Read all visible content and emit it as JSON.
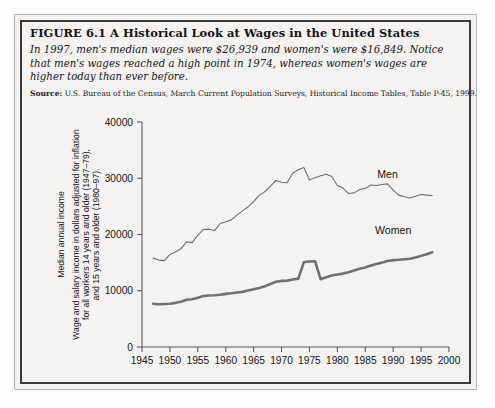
{
  "figure": {
    "title": "FIGURE 6.1  A Historical Look at Wages in the United States",
    "caption": "In 1997, men's median wages were $26,939 and women's were $16,849. Notice that men's wages reached a high point in 1974, whereas women's wages are higher today than ever before.",
    "source_label": "Source:",
    "source_text": " U.S. Bureau of the Census, March Current Population Surveys, Historical Income Tables, Table P-45, 1999."
  },
  "chart_data": {
    "type": "line",
    "title": "",
    "xlabel": "",
    "ylabel_top": "Median annual income",
    "ylabel": "Wage and salary income in dollars adjusted for inflation for all workers 14 years and older (1947–79), and 15 years and older (1980–97).",
    "ylabel_lines": [
      "Wage and salary income in dollars adjusted for inflation",
      "for all workers 14 years and older (1947–79),",
      "and 15 years and older (1980–97)."
    ],
    "xlim": [
      1945,
      2000
    ],
    "ylim": [
      0,
      40000
    ],
    "xticks": [
      1945,
      1950,
      1955,
      1960,
      1965,
      1970,
      1975,
      1980,
      1985,
      1990,
      1995,
      2000
    ],
    "yticks": [
      0,
      10000,
      20000,
      30000,
      40000
    ],
    "xtick_labels": [
      "1945",
      "1950",
      "1955",
      "1960",
      "1965",
      "1970",
      "1975",
      "1980",
      "1985",
      "1990",
      "1995",
      "2000"
    ],
    "ytick_labels": [
      "0",
      "10000",
      "20000",
      "30000",
      "40000"
    ],
    "grid": false,
    "legend_position": "inline-annotations",
    "annotations": [
      {
        "text": "Men",
        "x": 1989,
        "y": 30100
      },
      {
        "text": "Women",
        "x": 1990,
        "y": 20100
      }
    ],
    "series": [
      {
        "name": "Men",
        "color": "#6f6f6f",
        "width": 1.1,
        "x": [
          1947,
          1948,
          1949,
          1950,
          1951,
          1952,
          1953,
          1954,
          1955,
          1956,
          1957,
          1958,
          1959,
          1960,
          1961,
          1962,
          1963,
          1964,
          1965,
          1966,
          1967,
          1968,
          1969,
          1970,
          1971,
          1972,
          1973,
          1974,
          1975,
          1976,
          1977,
          1978,
          1979,
          1980,
          1981,
          1982,
          1983,
          1984,
          1985,
          1986,
          1987,
          1988,
          1989,
          1990,
          1991,
          1992,
          1993,
          1994,
          1995,
          1996,
          1997
        ],
        "values": [
          15800,
          15450,
          15350,
          16450,
          16900,
          17500,
          18700,
          18550,
          19900,
          20900,
          20950,
          20700,
          21950,
          22250,
          22600,
          23450,
          24200,
          24900,
          25850,
          27000,
          27600,
          28600,
          29600,
          29300,
          29200,
          30900,
          31500,
          31900,
          29700,
          30100,
          30450,
          30700,
          30300,
          28700,
          28250,
          27300,
          27400,
          28000,
          28200,
          28800,
          28700,
          28900,
          29000,
          27900,
          27000,
          26700,
          26500,
          26800,
          27100,
          27000,
          26939
        ]
      },
      {
        "name": "Women",
        "color": "#707070",
        "width": 2.6,
        "x": [
          1947,
          1948,
          1949,
          1950,
          1951,
          1952,
          1953,
          1954,
          1955,
          1956,
          1957,
          1958,
          1959,
          1960,
          1961,
          1962,
          1963,
          1964,
          1965,
          1966,
          1967,
          1968,
          1969,
          1970,
          1971,
          1972,
          1973,
          1974,
          1975,
          1976,
          1977,
          1978,
          1979,
          1980,
          1981,
          1982,
          1983,
          1984,
          1985,
          1986,
          1987,
          1988,
          1989,
          1990,
          1991,
          1992,
          1993,
          1994,
          1995,
          1996,
          1997
        ],
        "values": [
          7700,
          7600,
          7650,
          7700,
          7850,
          8050,
          8400,
          8500,
          8750,
          9050,
          9150,
          9200,
          9300,
          9450,
          9550,
          9700,
          9800,
          10050,
          10250,
          10500,
          10800,
          11200,
          11600,
          11750,
          11800,
          12000,
          12150,
          15100,
          15200,
          15250,
          12050,
          12400,
          12700,
          12900,
          13050,
          13300,
          13600,
          13900,
          14150,
          14500,
          14750,
          15000,
          15300,
          15450,
          15500,
          15600,
          15700,
          15900,
          16200,
          16500,
          16849
        ]
      }
    ]
  }
}
